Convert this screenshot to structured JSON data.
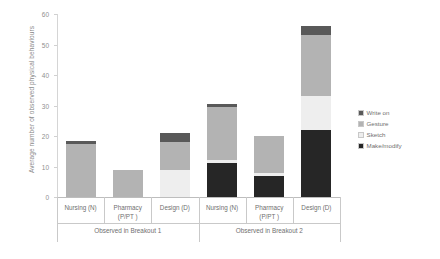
{
  "chart_data": {
    "type": "bar",
    "stacked": true,
    "title": "",
    "xlabel": "",
    "ylabel": "Average number of observed physical behaviours",
    "ylim": [
      0,
      60
    ],
    "yticks": [
      0,
      10,
      20,
      30,
      40,
      50,
      60
    ],
    "grid": false,
    "legend_position": "right",
    "categories": [
      "Nursing (N)",
      "Pharmacy (P/PT )",
      "Design (D)",
      "Nursing (N)",
      "Pharmacy (P/PT )",
      "Design (D)"
    ],
    "groups": [
      {
        "label": "Observed in Breakout 1",
        "categories": [
          "Nursing (N)",
          "Pharmacy (P/PT )",
          "Design (D)"
        ]
      },
      {
        "label": "Observed in Breakout 2",
        "categories": [
          "Nursing (N)",
          "Pharmacy (P/PT )",
          "Design (D)"
        ]
      }
    ],
    "series": [
      {
        "name": "Make/modify",
        "color": "#262626",
        "values": [
          0,
          0,
          0,
          11,
          7,
          22
        ]
      },
      {
        "name": "Sketch",
        "color": "#eeeeee",
        "values": [
          0,
          0,
          9,
          1,
          1,
          11
        ]
      },
      {
        "name": "Gesture",
        "color": "#b3b3b3",
        "values": [
          17.5,
          9,
          9,
          17.5,
          12,
          20
        ]
      },
      {
        "name": "Write on",
        "color": "#595959",
        "values": [
          1,
          0,
          3,
          1,
          0,
          3
        ]
      }
    ],
    "totals": [
      18.5,
      9,
      21,
      30.5,
      20,
      56
    ]
  },
  "legend": {
    "items": [
      {
        "label": "Write on",
        "color": "#595959"
      },
      {
        "label": "Gesture",
        "color": "#b3b3b3"
      },
      {
        "label": "Sketch",
        "color": "#eeeeee"
      },
      {
        "label": "Make/modify",
        "color": "#262626"
      }
    ]
  },
  "axis": {
    "y_title": "Average number of observed physical behaviours",
    "y_ticks": [
      "60",
      "50",
      "40",
      "30",
      "20",
      "10",
      "0"
    ]
  }
}
